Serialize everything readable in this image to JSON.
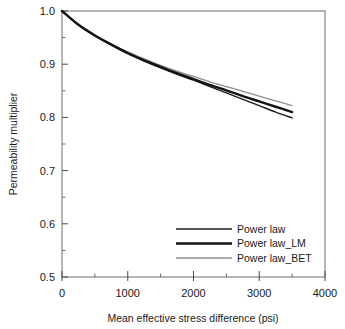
{
  "chart_data": {
    "type": "line",
    "title": "",
    "xlabel": "Mean effective stress difference (psi)",
    "ylabel": "Permeability multiplier",
    "xlim": [
      0,
      4000
    ],
    "ylim": [
      0.5,
      1.0
    ],
    "xticks": [
      0,
      1000,
      2000,
      3000,
      4000
    ],
    "xtick_labels": [
      "0",
      "1000",
      "2000",
      "3000",
      "4000"
    ],
    "xminor_interval": 500,
    "yticks": [
      0.5,
      0.6,
      0.7,
      0.8,
      0.9,
      1.0
    ],
    "ytick_labels": [
      "0.5",
      "0.6",
      "0.7",
      "0.8",
      "0.9",
      "1.0"
    ],
    "yminor_interval": 0.05,
    "grid": false,
    "legend_position": "lower right",
    "x": [
      0,
      250,
      500,
      750,
      1000,
      1250,
      1500,
      1750,
      2000,
      2250,
      2500,
      2750,
      3000,
      3250,
      3500
    ],
    "series": [
      {
        "name": "Power law",
        "color": "#1c1c1c",
        "width": 1.4,
        "values": [
          1.0,
          0.974,
          0.953,
          0.936,
          0.92,
          0.906,
          0.893,
          0.881,
          0.87,
          0.858,
          0.846,
          0.834,
          0.822,
          0.81,
          0.799
        ]
      },
      {
        "name": "Power law_LM",
        "color": "#141414",
        "width": 2.4,
        "values": [
          1.0,
          0.974,
          0.954,
          0.937,
          0.921,
          0.907,
          0.895,
          0.883,
          0.872,
          0.861,
          0.851,
          0.84,
          0.83,
          0.82,
          0.81
        ]
      },
      {
        "name": "Power law_BET",
        "color": "#8f8f8f",
        "width": 1.3,
        "values": [
          1.0,
          0.975,
          0.955,
          0.938,
          0.923,
          0.91,
          0.898,
          0.887,
          0.877,
          0.867,
          0.858,
          0.849,
          0.84,
          0.831,
          0.822
        ]
      }
    ]
  },
  "legend": {
    "entries": [
      {
        "label": "Power law"
      },
      {
        "label": "Power law_LM"
      },
      {
        "label": "Power law_BET"
      }
    ]
  },
  "axes": {
    "x_title": "Mean effective stress difference (psi)",
    "y_title": "Permeability multiplier"
  }
}
